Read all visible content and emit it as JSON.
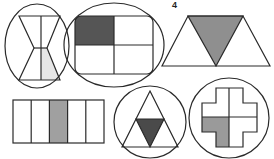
{
  "label": "4",
  "colors": {
    "stroke": "#2a2a2a",
    "dark_fill": "#555555",
    "mid_fill": "#9a9a9a",
    "light_fill": "#e6e6e6",
    "background": "#ffffff"
  },
  "figures": [
    {
      "id": "hourglass-in-ellipse",
      "parts": 4,
      "shaded": 1,
      "shade": "light",
      "shaded_part": "bottom-right"
    },
    {
      "id": "rounded-rect-in-ellipse",
      "parts": 4,
      "shaded": 1,
      "shade": "dark",
      "shaded_part": "top-left"
    },
    {
      "id": "trapezoid-of-triangles",
      "parts": 3,
      "shaded": 1,
      "shade": "mid",
      "shaded_part": "middle-inverted-triangle"
    },
    {
      "id": "rectangle-strips",
      "parts": 5,
      "shaded": 1,
      "shade": "mid",
      "shaded_part": "third-column"
    },
    {
      "id": "triangle-in-circle",
      "parts": 4,
      "shaded": 1,
      "shade": "dark",
      "shaded_part": "center-inverted-triangle"
    },
    {
      "id": "cross-in-circle",
      "parts": 4,
      "shaded": 1,
      "shade": "mid",
      "shaded_part": "bottom-left"
    }
  ]
}
